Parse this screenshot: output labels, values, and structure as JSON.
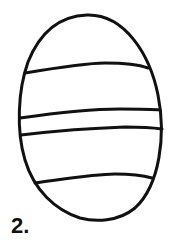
{
  "figure": {
    "number_label": "2.",
    "stroke_color": "#111111",
    "background_color": "#ffffff",
    "band_count": 4
  }
}
